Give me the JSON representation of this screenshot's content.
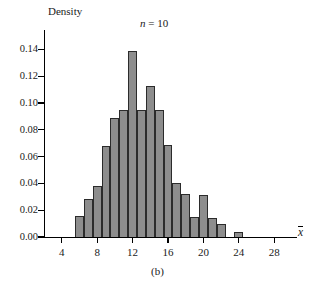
{
  "figure": {
    "caption": "(b)",
    "annotation_n": "n",
    "annotation_eq": " = ",
    "annotation_val": "10",
    "y_axis_title": "Density",
    "x_axis_title": "x"
  },
  "chart_data": {
    "type": "bar",
    "title": "",
    "subtitle": "n = 10",
    "xlabel": "x̄",
    "ylabel": "Density",
    "xlim": [
      2,
      30
    ],
    "ylim": [
      0,
      0.15
    ],
    "grid": false,
    "legend": null,
    "bar_width": 1,
    "x_ticks": [
      4,
      8,
      12,
      16,
      20,
      24,
      28
    ],
    "x_tick_labels": [
      "4",
      "8",
      "12",
      "16",
      "20",
      "24",
      "28"
    ],
    "y_ticks": [
      0.0,
      0.02,
      0.04,
      0.06,
      0.08,
      0.1,
      0.12,
      0.14
    ],
    "y_tick_labels": [
      "0.00",
      "0.02",
      "0.04",
      "0.06",
      "0.08",
      "0.10",
      "0.12",
      "0.14"
    ],
    "bin_edges": [
      5.5,
      6.5,
      7.5,
      8.5,
      9.5,
      10.5,
      11.5,
      12.5,
      13.5,
      14.5,
      15.5,
      16.5,
      17.5,
      18.5,
      19.5,
      20.5,
      21.5,
      22.5,
      23.5,
      24.5
    ],
    "bins": [
      {
        "x0": 5.5,
        "x1": 6.5,
        "density": 0.016
      },
      {
        "x0": 6.5,
        "x1": 7.5,
        "density": 0.028
      },
      {
        "x0": 7.5,
        "x1": 8.5,
        "density": 0.038
      },
      {
        "x0": 8.5,
        "x1": 9.5,
        "density": 0.068
      },
      {
        "x0": 9.5,
        "x1": 10.5,
        "density": 0.089
      },
      {
        "x0": 10.5,
        "x1": 11.5,
        "density": 0.095
      },
      {
        "x0": 11.5,
        "x1": 12.5,
        "density": 0.139
      },
      {
        "x0": 12.5,
        "x1": 13.5,
        "density": 0.095
      },
      {
        "x0": 13.5,
        "x1": 14.5,
        "density": 0.113
      },
      {
        "x0": 14.5,
        "x1": 15.5,
        "density": 0.095
      },
      {
        "x0": 15.5,
        "x1": 16.5,
        "density": 0.069
      },
      {
        "x0": 16.5,
        "x1": 17.5,
        "density": 0.04
      },
      {
        "x0": 17.5,
        "x1": 18.5,
        "density": 0.032
      },
      {
        "x0": 18.5,
        "x1": 19.5,
        "density": 0.015
      },
      {
        "x0": 19.5,
        "x1": 20.5,
        "density": 0.031
      },
      {
        "x0": 20.5,
        "x1": 21.5,
        "density": 0.014
      },
      {
        "x0": 21.5,
        "x1": 22.5,
        "density": 0.01
      },
      {
        "x0": 23.5,
        "x1": 24.5,
        "density": 0.004
      }
    ],
    "values": [
      0.016,
      0.028,
      0.038,
      0.068,
      0.089,
      0.095,
      0.139,
      0.095,
      0.113,
      0.095,
      0.069,
      0.04,
      0.032,
      0.015,
      0.031,
      0.014,
      0.01,
      0.004
    ],
    "categories": [
      "5.5-6.5",
      "6.5-7.5",
      "7.5-8.5",
      "8.5-9.5",
      "9.5-10.5",
      "10.5-11.5",
      "11.5-12.5",
      "12.5-13.5",
      "13.5-14.5",
      "14.5-15.5",
      "15.5-16.5",
      "16.5-17.5",
      "17.5-18.5",
      "18.5-19.5",
      "19.5-20.5",
      "20.5-21.5",
      "21.5-22.5",
      "23.5-24.5"
    ],
    "colors": {
      "bar_fill": "#8d8d8d",
      "bar_edge": "#2b2b2b",
      "axis": "#000000",
      "background": "#ffffff"
    }
  }
}
